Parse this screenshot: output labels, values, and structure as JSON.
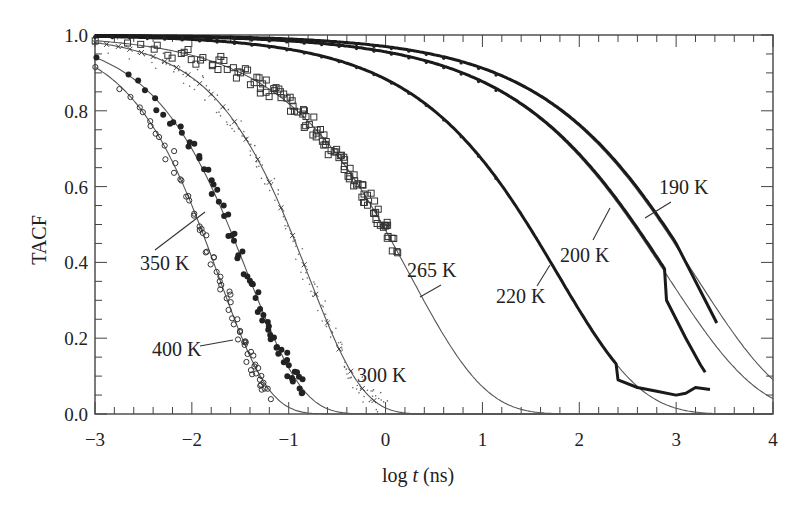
{
  "chart_data": {
    "type": "scatter",
    "title": "",
    "xlabel": "log t (ns)",
    "xlabel_parts": {
      "pre": "log ",
      "italic": "t",
      "post": " (ns)"
    },
    "ylabel": "TACF",
    "xlim": [
      -3,
      4
    ],
    "ylim": [
      0.0,
      1.0
    ],
    "xticks": [
      -3,
      -2,
      -1,
      0,
      1,
      2,
      3,
      4
    ],
    "xtick_labels": [
      "−3",
      "−2",
      "−1",
      "0",
      "1",
      "2",
      "3",
      "4"
    ],
    "yticks": [
      0.0,
      0.2,
      0.4,
      0.6,
      0.8,
      1.0
    ],
    "ytick_labels": [
      "0.0",
      "0.2",
      "0.4",
      "0.6",
      "0.8",
      "1.0"
    ],
    "grid": false,
    "legend": "none (inline annotations)",
    "fit_model": "KWW stretched exponential: TACF = exp(-(t/tau)^beta)",
    "series": [
      {
        "name": "400 K",
        "marker": "open-circle",
        "log_tau": -1.73,
        "beta": 0.83,
        "data_x_range": [
          -3.0,
          -1.2
        ],
        "half_decay_log_t": -1.92,
        "value_at_xmin": 0.915
      },
      {
        "name": "350 K",
        "marker": "filled-circle",
        "log_tau": -1.42,
        "beta": 0.77,
        "data_x_range": [
          -3.0,
          -0.85
        ],
        "half_decay_log_t": -1.63,
        "value_at_xmin": 0.94
      },
      {
        "name": "300 K",
        "marker": "cross-dots",
        "log_tau": -0.8,
        "beta": 0.77,
        "data_x_range": [
          -3.0,
          0.0
        ],
        "half_decay_log_t": -1.01,
        "value_at_xmin": 0.98
      },
      {
        "name": "265 K",
        "marker": "open-square",
        "log_tau": 0.25,
        "beta": 0.56,
        "data_x_range": [
          -3.0,
          0.1
        ],
        "half_decay_log_t": -0.03,
        "value_at_xmin": 0.985
      },
      {
        "name": "220 K",
        "marker": "small-dot-dense",
        "log_tau": 1.78,
        "beta": 0.51,
        "data_x_range": [
          -3.0,
          3.35
        ],
        "half_decay_log_t": 1.47,
        "value_at_xmin": 0.997
      },
      {
        "name": "200 K",
        "marker": "small-dot-dense",
        "log_tau": 2.9,
        "beta": 0.46,
        "data_x_range": [
          -3.0,
          3.3
        ],
        "half_decay_log_t": 2.55,
        "value_at_xmin": 0.998
      },
      {
        "name": "190 K",
        "marker": "small-dot-dense",
        "log_tau": 3.19,
        "beta": 0.47,
        "data_x_range": [
          -3.0,
          3.42
        ],
        "half_decay_log_t": 2.85,
        "value_at_xmin": 0.999
      }
    ],
    "annotations": [
      {
        "text": "350 K",
        "x_px": 140,
        "y_px": 270,
        "line": [
          [
            155,
            250
          ],
          [
            205,
            212
          ]
        ]
      },
      {
        "text": "400 K",
        "x_px": 152,
        "y_px": 356,
        "line": [
          [
            200,
            346
          ],
          [
            233,
            340
          ]
        ]
      },
      {
        "text": "300 K",
        "x_px": 357,
        "y_px": 382,
        "line": null
      },
      {
        "text": "265 K",
        "x_px": 407,
        "y_px": 277,
        "line": [
          [
            420,
            297
          ],
          [
            441,
            285
          ]
        ]
      },
      {
        "text": "220 K",
        "x_px": 496,
        "y_px": 303,
        "line": [
          [
            537,
            286
          ],
          [
            550,
            265
          ]
        ]
      },
      {
        "text": "200 K",
        "x_px": 560,
        "y_px": 262,
        "line": [
          [
            593,
            240
          ],
          [
            610,
            208
          ]
        ]
      },
      {
        "text": "190 K",
        "x_px": 659,
        "y_px": 194,
        "line": [
          [
            645,
            218
          ],
          [
            671,
            202
          ]
        ]
      }
    ],
    "data_tail_220K": [
      [
        2.4,
        0.09
      ],
      [
        2.6,
        0.07
      ],
      [
        2.8,
        0.06
      ],
      [
        3.0,
        0.05
      ],
      [
        3.1,
        0.055
      ],
      [
        3.2,
        0.07
      ],
      [
        3.35,
        0.065
      ]
    ],
    "data_tail_200K": [
      [
        2.9,
        0.3
      ],
      [
        3.1,
        0.2
      ],
      [
        3.25,
        0.13
      ],
      [
        3.3,
        0.11
      ]
    ],
    "data_tail_190K": [
      [
        3.0,
        0.45
      ],
      [
        3.1,
        0.4
      ],
      [
        3.3,
        0.3
      ],
      [
        3.42,
        0.24
      ]
    ]
  }
}
